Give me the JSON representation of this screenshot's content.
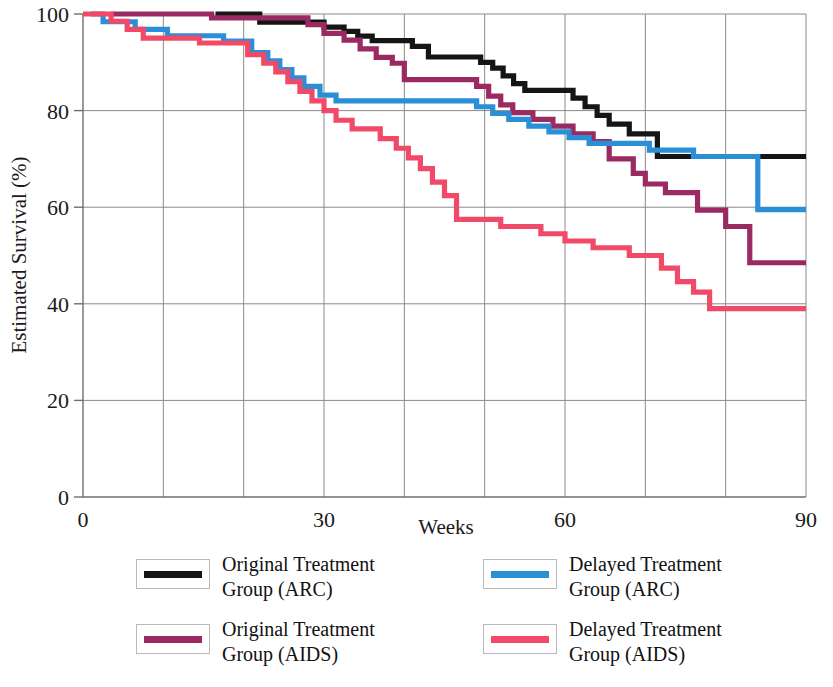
{
  "chart_data": {
    "type": "line",
    "subtype": "kaplan-meier-step",
    "title": "",
    "xlabel": "Weeks",
    "ylabel": "Estimated Survival (%)",
    "xlim": [
      0,
      90
    ],
    "ylim": [
      0,
      100
    ],
    "xticks": [
      0,
      30,
      60,
      90
    ],
    "xtick_labels": [
      "0",
      "30",
      "60",
      "90"
    ],
    "yticks": [
      0,
      20,
      40,
      60,
      80,
      100
    ],
    "ytick_labels": [
      "0",
      "20",
      "40",
      "60",
      "80",
      "100"
    ],
    "x_gridlines": [
      10,
      20,
      30,
      40,
      50,
      60,
      70,
      80
    ],
    "y_gridlines": [
      20,
      40,
      60,
      80
    ],
    "grid": true,
    "legend_position": "below-plot",
    "series": [
      {
        "name": "Original Treatment Group (ARC)",
        "short": "original-arc",
        "color": "#151515",
        "final_value": 70.5,
        "points": [
          [
            16.5,
            100
          ],
          [
            22.0,
            100
          ],
          [
            22.0,
            98.3
          ],
          [
            30.0,
            98.3
          ],
          [
            30.0,
            97.3
          ],
          [
            32.5,
            97.3
          ],
          [
            32.5,
            96.4
          ],
          [
            34.2,
            96.4
          ],
          [
            34.2,
            95.4
          ],
          [
            36.0,
            95.4
          ],
          [
            36.0,
            94.5
          ],
          [
            41.0,
            94.5
          ],
          [
            41.0,
            93.3
          ],
          [
            43.0,
            93.3
          ],
          [
            43.0,
            91.1
          ],
          [
            49.5,
            91.1
          ],
          [
            49.5,
            90.0
          ],
          [
            51.0,
            90.0
          ],
          [
            51.0,
            88.8
          ],
          [
            52.3,
            88.8
          ],
          [
            52.3,
            87.2
          ],
          [
            53.6,
            87.2
          ],
          [
            53.6,
            85.6
          ],
          [
            55.0,
            85.6
          ],
          [
            55.0,
            84.2
          ],
          [
            61.0,
            84.2
          ],
          [
            61.0,
            82.6
          ],
          [
            62.5,
            82.6
          ],
          [
            62.5,
            80.8
          ],
          [
            64.0,
            80.8
          ],
          [
            64.0,
            79.0
          ],
          [
            65.5,
            79.0
          ],
          [
            65.5,
            77.2
          ],
          [
            68.0,
            77.2
          ],
          [
            68.0,
            75.2
          ],
          [
            71.5,
            75.2
          ],
          [
            71.5,
            70.5
          ],
          [
            90.0,
            70.5
          ]
        ]
      },
      {
        "name": "Original Treatment Group (AIDS)",
        "short": "original-aids",
        "color": "#9B2A63",
        "final_value": 48.5,
        "points": [
          [
            3.5,
            100
          ],
          [
            16.0,
            100
          ],
          [
            16.0,
            99.2
          ],
          [
            28.0,
            99.2
          ],
          [
            28.0,
            97.8
          ],
          [
            30.0,
            97.8
          ],
          [
            30.0,
            96.0
          ],
          [
            32.5,
            96.0
          ],
          [
            32.5,
            94.6
          ],
          [
            34.5,
            94.6
          ],
          [
            34.5,
            92.8
          ],
          [
            36.5,
            92.8
          ],
          [
            36.5,
            91.0
          ],
          [
            38.5,
            91.0
          ],
          [
            38.5,
            89.8
          ],
          [
            40.0,
            89.8
          ],
          [
            40.0,
            86.4
          ],
          [
            49.0,
            86.4
          ],
          [
            49.0,
            85.0
          ],
          [
            50.5,
            85.0
          ],
          [
            50.5,
            83.0
          ],
          [
            52.0,
            83.0
          ],
          [
            52.0,
            81.2
          ],
          [
            53.5,
            81.2
          ],
          [
            53.5,
            79.6
          ],
          [
            56.0,
            79.6
          ],
          [
            56.0,
            78.2
          ],
          [
            58.5,
            78.2
          ],
          [
            58.5,
            76.8
          ],
          [
            61.0,
            76.8
          ],
          [
            61.0,
            75.2
          ],
          [
            63.5,
            75.2
          ],
          [
            63.5,
            73.6
          ],
          [
            65.5,
            73.6
          ],
          [
            65.5,
            70.0
          ],
          [
            68.5,
            70.0
          ],
          [
            68.5,
            67.0
          ],
          [
            70.0,
            67.0
          ],
          [
            70.0,
            64.8
          ],
          [
            72.5,
            64.8
          ],
          [
            72.5,
            63.0
          ],
          [
            76.5,
            63.0
          ],
          [
            76.5,
            59.4
          ],
          [
            80.0,
            59.4
          ],
          [
            80.0,
            56.0
          ],
          [
            83.0,
            56.0
          ],
          [
            83.0,
            48.5
          ],
          [
            90.0,
            48.5
          ]
        ]
      },
      {
        "name": "Delayed Treatment Group (ARC)",
        "short": "delayed-arc",
        "color": "#2B8FD8",
        "final_value": 59.5,
        "points": [
          [
            1.0,
            100
          ],
          [
            2.5,
            100
          ],
          [
            2.5,
            98.4
          ],
          [
            6.5,
            98.4
          ],
          [
            6.5,
            96.8
          ],
          [
            10.5,
            96.8
          ],
          [
            10.5,
            95.5
          ],
          [
            17.5,
            95.5
          ],
          [
            17.5,
            94.4
          ],
          [
            21.0,
            94.4
          ],
          [
            21.0,
            92.0
          ],
          [
            23.0,
            92.0
          ],
          [
            23.0,
            90.3
          ],
          [
            24.5,
            90.3
          ],
          [
            24.5,
            88.5
          ],
          [
            26.0,
            88.5
          ],
          [
            26.0,
            86.8
          ],
          [
            27.5,
            86.8
          ],
          [
            27.5,
            85.0
          ],
          [
            29.5,
            85.0
          ],
          [
            29.5,
            83.2
          ],
          [
            31.5,
            83.2
          ],
          [
            31.5,
            82.0
          ],
          [
            49.0,
            82.0
          ],
          [
            49.0,
            80.8
          ],
          [
            51.0,
            80.8
          ],
          [
            51.0,
            79.4
          ],
          [
            53.0,
            79.4
          ],
          [
            53.0,
            78.2
          ],
          [
            55.5,
            78.2
          ],
          [
            55.5,
            76.8
          ],
          [
            58.0,
            76.8
          ],
          [
            58.0,
            75.6
          ],
          [
            60.5,
            75.6
          ],
          [
            60.5,
            74.4
          ],
          [
            63.0,
            74.4
          ],
          [
            63.0,
            73.2
          ],
          [
            70.5,
            73.2
          ],
          [
            70.5,
            71.8
          ],
          [
            76.0,
            71.8
          ],
          [
            76.0,
            70.5
          ],
          [
            84.0,
            70.5
          ],
          [
            84.0,
            59.5
          ],
          [
            90.0,
            59.5
          ]
        ]
      },
      {
        "name": "Delayed Treatment Group (AIDS)",
        "short": "delayed-aids",
        "color": "#F04A68",
        "final_value": 39.0,
        "points": [
          [
            0.0,
            100
          ],
          [
            3.5,
            100
          ],
          [
            3.5,
            98.5
          ],
          [
            5.5,
            98.5
          ],
          [
            5.5,
            96.8
          ],
          [
            7.5,
            96.8
          ],
          [
            7.5,
            95.0
          ],
          [
            14.5,
            95.0
          ],
          [
            14.5,
            94.0
          ],
          [
            20.5,
            94.0
          ],
          [
            20.5,
            91.6
          ],
          [
            22.5,
            91.6
          ],
          [
            22.5,
            89.8
          ],
          [
            24.0,
            89.8
          ],
          [
            24.0,
            88.0
          ],
          [
            25.5,
            88.0
          ],
          [
            25.5,
            86.0
          ],
          [
            27.0,
            86.0
          ],
          [
            27.0,
            84.0
          ],
          [
            28.5,
            84.0
          ],
          [
            28.5,
            82.0
          ],
          [
            30.0,
            82.0
          ],
          [
            30.0,
            80.0
          ],
          [
            31.5,
            80.0
          ],
          [
            31.5,
            78.0
          ],
          [
            33.5,
            78.0
          ],
          [
            33.5,
            76.2
          ],
          [
            37.0,
            76.2
          ],
          [
            37.0,
            74.2
          ],
          [
            39.0,
            74.2
          ],
          [
            39.0,
            72.2
          ],
          [
            40.5,
            72.2
          ],
          [
            40.5,
            70.2
          ],
          [
            42.0,
            70.2
          ],
          [
            42.0,
            68.0
          ],
          [
            43.5,
            68.0
          ],
          [
            43.5,
            65.2
          ],
          [
            45.0,
            65.2
          ],
          [
            45.0,
            62.4
          ],
          [
            46.5,
            62.4
          ],
          [
            46.5,
            57.5
          ],
          [
            52.0,
            57.5
          ],
          [
            52.0,
            56.0
          ],
          [
            57.0,
            56.0
          ],
          [
            57.0,
            54.5
          ],
          [
            60.0,
            54.5
          ],
          [
            60.0,
            53.0
          ],
          [
            63.5,
            53.0
          ],
          [
            63.5,
            51.6
          ],
          [
            68.0,
            51.6
          ],
          [
            68.0,
            50.0
          ],
          [
            72.0,
            50.0
          ],
          [
            72.0,
            47.4
          ],
          [
            74.0,
            47.4
          ],
          [
            74.0,
            44.6
          ],
          [
            76.0,
            44.6
          ],
          [
            76.0,
            42.4
          ],
          [
            78.0,
            42.4
          ],
          [
            78.0,
            39.0
          ],
          [
            90.0,
            39.0
          ]
        ]
      }
    ]
  },
  "axes": {
    "ylabel": "Estimated Survival (%)",
    "xlabel": "Weeks",
    "ytick_labels": [
      "100",
      "80",
      "60",
      "40",
      "20",
      "0"
    ],
    "xtick_labels": [
      "0",
      "30",
      "60",
      "90"
    ]
  },
  "legend": {
    "items": [
      {
        "label": "Original Treatment\nGroup (ARC)",
        "color": "#151515"
      },
      {
        "label": "Delayed Treatment\nGroup (ARC)",
        "color": "#2B8FD8"
      },
      {
        "label": "Original Treatment\nGroup (AIDS)",
        "color": "#9B2A63"
      },
      {
        "label": "Delayed Treatment\nGroup (AIDS)",
        "color": "#F04A68"
      }
    ]
  },
  "colors": {
    "original_arc": "#151515",
    "original_aids": "#9B2A63",
    "delayed_arc": "#2B8FD8",
    "delayed_aids": "#F04A68",
    "grid": "#8a8a8a",
    "axis": "#6f6f6f"
  }
}
